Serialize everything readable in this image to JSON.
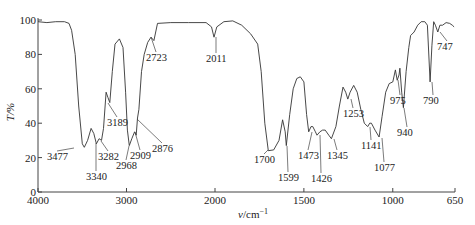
{
  "chart_data": {
    "type": "line",
    "title": "",
    "xlabel": "v/cm⁻¹",
    "ylabel": "T/%",
    "xlim": [
      4000,
      650
    ],
    "ylim": [
      0,
      100
    ],
    "x_scale_note": "split scale: 4000-2000 compressed, 2000-650 expanded 2x",
    "x_ticks": [
      4000,
      3000,
      2000,
      1500,
      1000,
      650
    ],
    "y_ticks": [
      0,
      20,
      40,
      60,
      80,
      100
    ],
    "grid": false,
    "legend": null,
    "series": [
      {
        "name": "IR spectrum",
        "x": [
          4000,
          3900,
          3800,
          3700,
          3650,
          3620,
          3580,
          3540,
          3500,
          3477,
          3440,
          3400,
          3370,
          3340,
          3310,
          3282,
          3260,
          3230,
          3210,
          3189,
          3160,
          3130,
          3080,
          3040,
          3010,
          2990,
          2968,
          2940,
          2909,
          2890,
          2876,
          2860,
          2830,
          2800,
          2760,
          2723,
          2690,
          2650,
          2500,
          2300,
          2100,
          2040,
          2011,
          1990,
          1950,
          1900,
          1850,
          1800,
          1760,
          1740,
          1720,
          1700,
          1670,
          1640,
          1620,
          1605,
          1599,
          1580,
          1560,
          1540,
          1520,
          1500,
          1485,
          1473,
          1460,
          1450,
          1435,
          1426,
          1410,
          1395,
          1380,
          1360,
          1345,
          1320,
          1300,
          1280,
          1265,
          1253,
          1240,
          1220,
          1200,
          1180,
          1160,
          1141,
          1130,
          1120,
          1100,
          1077,
          1060,
          1040,
          1020,
          1000,
          985,
          975,
          965,
          960,
          950,
          940,
          925,
          910,
          900,
          880,
          860,
          840,
          820,
          805,
          790,
          780,
          770,
          760,
          747,
          735,
          720,
          700,
          680,
          665,
          655
        ],
        "values": [
          99,
          98.5,
          99,
          99,
          98,
          94,
          80,
          50,
          28,
          26,
          30,
          37,
          34,
          28,
          31,
          30,
          37,
          58,
          55,
          52,
          70,
          86,
          89,
          84,
          58,
          36,
          27,
          31,
          35,
          33,
          43,
          48,
          70,
          80,
          87,
          90,
          88,
          98,
          98.5,
          98.5,
          98.5,
          96,
          90,
          96,
          99,
          99.5,
          97,
          92,
          86,
          70,
          40,
          24,
          24.5,
          30,
          42,
          35,
          27,
          45,
          60,
          66,
          67,
          64,
          45,
          35,
          38,
          38,
          35,
          33,
          35,
          36,
          36,
          33,
          31,
          38,
          50,
          61,
          58,
          54,
          58,
          62,
          58,
          48,
          40,
          38,
          40,
          40,
          36,
          32,
          44,
          58,
          63,
          64,
          71,
          65,
          68,
          72,
          58,
          49,
          70,
          84,
          91,
          93,
          97,
          99,
          99,
          97,
          64,
          85,
          99,
          97,
          93,
          97,
          97,
          98.5,
          98,
          97,
          96
        ]
      }
    ],
    "annotations": [
      {
        "label": "3477",
        "x": 3477
      },
      {
        "label": "3340",
        "x": 3340
      },
      {
        "label": "3282",
        "x": 3282
      },
      {
        "label": "3189",
        "x": 3189
      },
      {
        "label": "2968",
        "x": 2968
      },
      {
        "label": "2909",
        "x": 2909
      },
      {
        "label": "2876",
        "x": 2876
      },
      {
        "label": "2723",
        "x": 2723
      },
      {
        "label": "2011",
        "x": 2011
      },
      {
        "label": "1700",
        "x": 1700
      },
      {
        "label": "1599",
        "x": 1599
      },
      {
        "label": "1473",
        "x": 1473
      },
      {
        "label": "1426",
        "x": 1426
      },
      {
        "label": "1345",
        "x": 1345
      },
      {
        "label": "1253",
        "x": 1253
      },
      {
        "label": "1141",
        "x": 1141
      },
      {
        "label": "1077",
        "x": 1077
      },
      {
        "label": "975",
        "x": 975
      },
      {
        "label": "940",
        "x": 940
      },
      {
        "label": "790",
        "x": 790
      },
      {
        "label": "747",
        "x": 747
      }
    ]
  },
  "axes": {
    "x_title_italic": "v",
    "x_title_unit": "/cm",
    "x_title_sup": "−1",
    "y_title": "T/%",
    "x_tick_labels": [
      "4000",
      "3000",
      "2000",
      "1500",
      "1000",
      "650"
    ],
    "y_tick_labels": [
      "0",
      "20",
      "40",
      "60",
      "80",
      "100"
    ]
  },
  "peak_labels": [
    {
      "text": "3477",
      "px": 74,
      "py": 148,
      "lx": 47,
      "ly": 160,
      "anchor": "start"
    },
    {
      "text": "3340",
      "px": 96,
      "py": 143,
      "lx": 86,
      "ly": 180,
      "anchor": "start"
    },
    {
      "text": "3282",
      "px": 101,
      "py": 141,
      "lx": 98,
      "ly": 160,
      "anchor": "start"
    },
    {
      "text": "3189",
      "px": 108,
      "py": 103,
      "lx": 107,
      "ly": 126,
      "anchor": "start"
    },
    {
      "text": "2968",
      "px": 129,
      "py": 146,
      "lx": 116,
      "ly": 169,
      "anchor": "start"
    },
    {
      "text": "2909",
      "px": 135,
      "py": 132,
      "lx": 130,
      "ly": 159,
      "anchor": "start"
    },
    {
      "text": "2876",
      "px": 137,
      "py": 119,
      "lx": 152,
      "ly": 152,
      "anchor": "start"
    },
    {
      "text": "2723",
      "px": 151,
      "py": 37,
      "lx": 146,
      "ly": 61,
      "anchor": "start"
    },
    {
      "text": "2011",
      "px": 216,
      "py": 37,
      "lx": 206,
      "ly": 62,
      "anchor": "start"
    },
    {
      "text": "1700",
      "px": 268,
      "py": 150,
      "lx": 254,
      "ly": 163,
      "anchor": "start"
    },
    {
      "text": "1599",
      "px": 287,
      "py": 146,
      "lx": 278,
      "ly": 181,
      "anchor": "start"
    },
    {
      "text": "1473",
      "px": 312,
      "py": 132,
      "lx": 298,
      "ly": 159,
      "anchor": "start"
    },
    {
      "text": "1426",
      "px": 320,
      "py": 135,
      "lx": 311,
      "ly": 182,
      "anchor": "start"
    },
    {
      "text": "1345",
      "px": 334,
      "py": 139,
      "lx": 327,
      "ly": 159,
      "anchor": "start"
    },
    {
      "text": "1253",
      "px": 351,
      "py": 99,
      "lx": 343,
      "ly": 117,
      "anchor": "start"
    },
    {
      "text": "1141",
      "px": 370,
      "py": 127,
      "lx": 361,
      "ly": 149,
      "anchor": "start"
    },
    {
      "text": "1077",
      "px": 382,
      "py": 138,
      "lx": 374,
      "ly": 171,
      "anchor": "start"
    },
    {
      "text": "975",
      "px": 398,
      "py": 80,
      "lx": 390,
      "ly": 104,
      "anchor": "start"
    },
    {
      "text": "940",
      "px": 404,
      "py": 108,
      "lx": 397,
      "ly": 136,
      "anchor": "start"
    },
    {
      "text": "790",
      "px": 432,
      "py": 82,
      "lx": 423,
      "ly": 104,
      "anchor": "start"
    },
    {
      "text": "747",
      "px": 440,
      "py": 32,
      "lx": 437,
      "ly": 50,
      "anchor": "start"
    }
  ],
  "colors": {
    "line": "#333333",
    "axis": "#444444",
    "text": "#222222",
    "background": "#ffffff"
  }
}
